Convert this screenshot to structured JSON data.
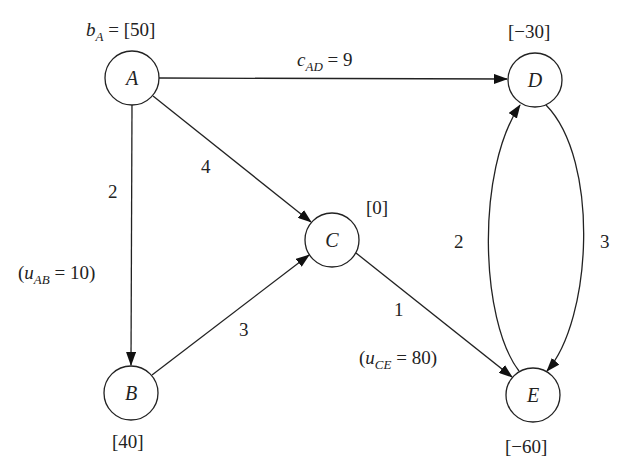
{
  "diagram": {
    "type": "network-flow",
    "nodes": [
      {
        "id": "A",
        "supply_label": "bA = [50]",
        "supply": "[50]"
      },
      {
        "id": "B",
        "supply_label": "[40]"
      },
      {
        "id": "C",
        "supply_label": "[0]"
      },
      {
        "id": "D",
        "supply_label": "[−30]"
      },
      {
        "id": "E",
        "supply_label": "[−60]"
      }
    ],
    "edges": [
      {
        "from": "A",
        "to": "D",
        "cost_label": "cAD = 9",
        "cost": "9"
      },
      {
        "from": "A",
        "to": "C",
        "cost": "4"
      },
      {
        "from": "A",
        "to": "B",
        "cost": "2",
        "capacity_label": "(uAB = 10)",
        "capacity": "10"
      },
      {
        "from": "B",
        "to": "C",
        "cost": "3"
      },
      {
        "from": "C",
        "to": "E",
        "cost": "1",
        "capacity_label": "(uCE = 80)",
        "capacity": "80"
      },
      {
        "from": "E",
        "to": "D",
        "cost": "2"
      },
      {
        "from": "D",
        "to": "E",
        "cost": "3"
      }
    ]
  },
  "labels": {
    "bA_var": "b",
    "bA_sub": "A",
    "bA_eq": " = [50]",
    "cAD_var": "c",
    "cAD_sub": "AD",
    "cAD_eq": " = 9",
    "uAB_open": "(",
    "uAB_var": "u",
    "uAB_sub": "AB",
    "uAB_eq": " = 10)",
    "uCE_open": "(",
    "uCE_var": "u",
    "uCE_sub": "CE",
    "uCE_eq": " = 80)",
    "A": "A",
    "B": "B",
    "C": "C",
    "D": "D",
    "E": "E",
    "supply_B": "[40]",
    "supply_C": "[0]",
    "supply_D": "[−30]",
    "supply_E": "[−60]",
    "cost_AC": "4",
    "cost_AB": "2",
    "cost_BC": "3",
    "cost_CE": "1",
    "cost_ED": "2",
    "cost_DE": "3"
  }
}
